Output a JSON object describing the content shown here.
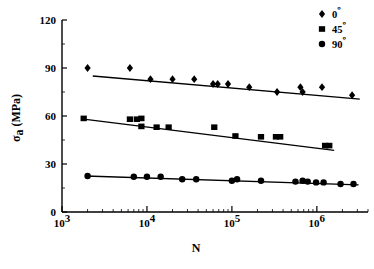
{
  "chart_data": {
    "type": "scatter",
    "title": "",
    "xlabel": "N",
    "ylabel": "σa (MPa)",
    "ylabel_main": "σ",
    "ylabel_sub": "a",
    "ylabel_unit": " (MPa)",
    "xscale": "log",
    "yscale": "linear",
    "xlim": [
      1000,
      4000000
    ],
    "ylim": [
      0,
      120
    ],
    "grid": false,
    "legend_position": "top-right",
    "y_ticks": [
      0,
      30,
      60,
      90,
      120
    ],
    "y_tick_labels": [
      "0",
      "30",
      "60",
      "90",
      "120"
    ],
    "x_ticks": [
      1000,
      10000,
      100000,
      1000000
    ],
    "x_tick_labels": [
      "10",
      "10",
      "10",
      "10"
    ],
    "x_tick_exponents": [
      "3",
      "4",
      "5",
      "6"
    ],
    "legend": [
      {
        "label": "0",
        "degree": "º",
        "marker": "diamond",
        "color": "#000000"
      },
      {
        "label": "45",
        "degree": "º",
        "marker": "square",
        "color": "#000000"
      },
      {
        "label": "90",
        "degree": "º",
        "marker": "circle",
        "color": "#000000"
      }
    ],
    "series": [
      {
        "name": "0º",
        "marker": "diamond",
        "color": "#000000",
        "points": [
          [
            2000,
            90.0
          ],
          [
            6300,
            90.0
          ],
          [
            11000,
            83.0
          ],
          [
            20000,
            83.0
          ],
          [
            36000,
            83.0
          ],
          [
            60000,
            80.0
          ],
          [
            68000,
            80.0
          ],
          [
            90000,
            80.0
          ],
          [
            160000,
            78.0
          ],
          [
            340000,
            75.0
          ],
          [
            640000,
            78.0
          ],
          [
            680000,
            75.0
          ],
          [
            1150000,
            78.0
          ],
          [
            2600000,
            73.0
          ]
        ],
        "trend_line": [
          [
            2300,
            85.0
          ],
          [
            3200000,
            70.5
          ]
        ]
      },
      {
        "name": "45º",
        "marker": "square",
        "color": "#000000",
        "points": [
          [
            1800,
            58.5
          ],
          [
            6300,
            58.0
          ],
          [
            7600,
            58.0
          ],
          [
            8600,
            58.5
          ],
          [
            8600,
            53.5
          ],
          [
            13000,
            53.0
          ],
          [
            18000,
            53.0
          ],
          [
            62000,
            53.0
          ],
          [
            110000,
            47.5
          ],
          [
            220000,
            47.0
          ],
          [
            330000,
            47.0
          ],
          [
            370000,
            47.0
          ],
          [
            1250000,
            41.5
          ],
          [
            1400000,
            41.5
          ]
        ],
        "trend_line": [
          [
            1800,
            58.0
          ],
          [
            1600000,
            38.5
          ]
        ]
      },
      {
        "name": "90º",
        "marker": "circle",
        "color": "#000000",
        "points": [
          [
            2000,
            22.5
          ],
          [
            7000,
            22.0
          ],
          [
            10000,
            22.0
          ],
          [
            14500,
            22.0
          ],
          [
            26000,
            20.5
          ],
          [
            38000,
            20.5
          ],
          [
            100000,
            19.5
          ],
          [
            115000,
            20.5
          ],
          [
            220000,
            19.5
          ],
          [
            560000,
            19.0
          ],
          [
            680000,
            19.5
          ],
          [
            780000,
            19.0
          ],
          [
            980000,
            18.5
          ],
          [
            1200000,
            18.5
          ],
          [
            1900000,
            17.5
          ],
          [
            2700000,
            17.5
          ]
        ],
        "trend_line": [
          [
            1900,
            22.5
          ],
          [
            3100000,
            17.0
          ]
        ]
      }
    ]
  }
}
